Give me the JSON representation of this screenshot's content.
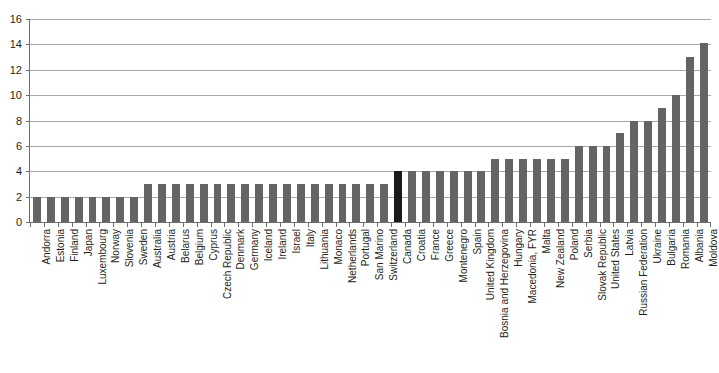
{
  "chart_data": {
    "type": "bar",
    "title": "",
    "subtitle": "",
    "xlabel": "",
    "ylabel": "",
    "ylim": [
      0,
      16
    ],
    "ytick_values": [
      16,
      14,
      12,
      10,
      8,
      6,
      4,
      2,
      0
    ],
    "ytick_labels": [
      "16",
      "14",
      "12",
      "10",
      "8",
      "6",
      "4",
      "2",
      "0"
    ],
    "grid": true,
    "legend": "none",
    "bar_color": "#636466",
    "highlight_color": "#1a1a1a",
    "highlight_category": "Canada",
    "categories": [
      "Andorra",
      "Estonia",
      "Finland",
      "Japan",
      "Luxembourg",
      "Norway",
      "Slovenia",
      "Sweden",
      "Australia",
      "Austria",
      "Belarus",
      "Belgium",
      "Cyprus",
      "Czech Republic",
      "Denmark",
      "Germany",
      "Iceland",
      "Ireland",
      "Israel",
      "Italy",
      "Lithuania",
      "Monaco",
      "Netherlands",
      "Portugal",
      "San Marino",
      "Switzerland",
      "Canada",
      "Croatia",
      "France",
      "Greece",
      "Montenegro",
      "Spain",
      "United Kingdom",
      "Bosnia and Herzegovina",
      "Hungary",
      "Macedonia, FYR",
      "Malta",
      "New Zealand",
      "Poland",
      "Serbia",
      "Slovak Republic",
      "United States",
      "Latvia",
      "Russian Federation",
      "Ukraine",
      "Bulgaria",
      "Romania",
      "Albania",
      "Moldova"
    ],
    "values": [
      2,
      2,
      2,
      2,
      2,
      2,
      2,
      2,
      3,
      3,
      3,
      3,
      3,
      3,
      3,
      3,
      3,
      3,
      3,
      3,
      3,
      3,
      3,
      3,
      3,
      3,
      4,
      4,
      4,
      4,
      4,
      4,
      4,
      5,
      5,
      5,
      5,
      5,
      5,
      6,
      6,
      6,
      7,
      8,
      8,
      9,
      10,
      13,
      14.1
    ]
  }
}
